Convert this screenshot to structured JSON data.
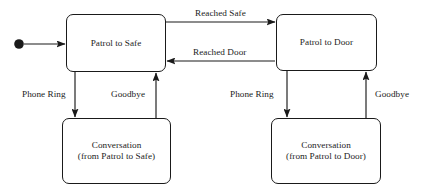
{
  "diagram": {
    "type": "state-machine",
    "width": 425,
    "height": 193,
    "background": "#ffffff",
    "stroke_color": "#1a1a1a",
    "text_color": "#1c1c1c",
    "states": [
      {
        "id": "patrol-to-safe",
        "line1": "Patrol to Safe",
        "line2": "",
        "x": 66,
        "y": 14,
        "w": 100,
        "h": 58
      },
      {
        "id": "patrol-to-door",
        "line1": "Patrol to Door",
        "line2": "",
        "x": 276,
        "y": 14,
        "w": 101,
        "h": 57
      },
      {
        "id": "conversation-from-patrol-to-safe",
        "line1": "Conversation",
        "line2": "(from Patrol to Safe)",
        "x": 62,
        "y": 118,
        "w": 109,
        "h": 66
      },
      {
        "id": "conversation-from-patrol-to-door",
        "line1": "Conversation",
        "line2": "(from Patrol to Door)",
        "x": 271,
        "y": 118,
        "w": 110,
        "h": 66
      }
    ],
    "initial_marker": {
      "cx": 19,
      "cy": 44,
      "r": 4.8
    },
    "transitions": [
      {
        "id": "reached-safe",
        "label": "Reached Safe",
        "from": "patrol-to-safe",
        "to": "patrol-to-door",
        "label_x": 194,
        "label_y": 8
      },
      {
        "id": "reached-door",
        "label": "Reached Door",
        "from": "patrol-to-door",
        "to": "patrol-to-safe",
        "label_x": 192,
        "label_y": 47
      },
      {
        "id": "phone-ring-left",
        "label": "Phone Ring",
        "from": "patrol-to-safe",
        "to": "conversation-from-patrol-to-safe",
        "label_x": 21,
        "label_y": 89
      },
      {
        "id": "goodbye-left",
        "label": "Goodbye",
        "from": "conversation-from-patrol-to-safe",
        "to": "patrol-to-safe",
        "label_x": 110,
        "label_y": 89
      },
      {
        "id": "phone-ring-right",
        "label": "Phone Ring",
        "from": "patrol-to-door",
        "to": "conversation-from-patrol-to-door",
        "label_x": 229,
        "label_y": 89
      },
      {
        "id": "goodbye-right",
        "label": "Goodbye",
        "from": "conversation-from-patrol-to-door",
        "to": "patrol-to-door",
        "label_x": 374,
        "label_y": 89
      }
    ]
  }
}
